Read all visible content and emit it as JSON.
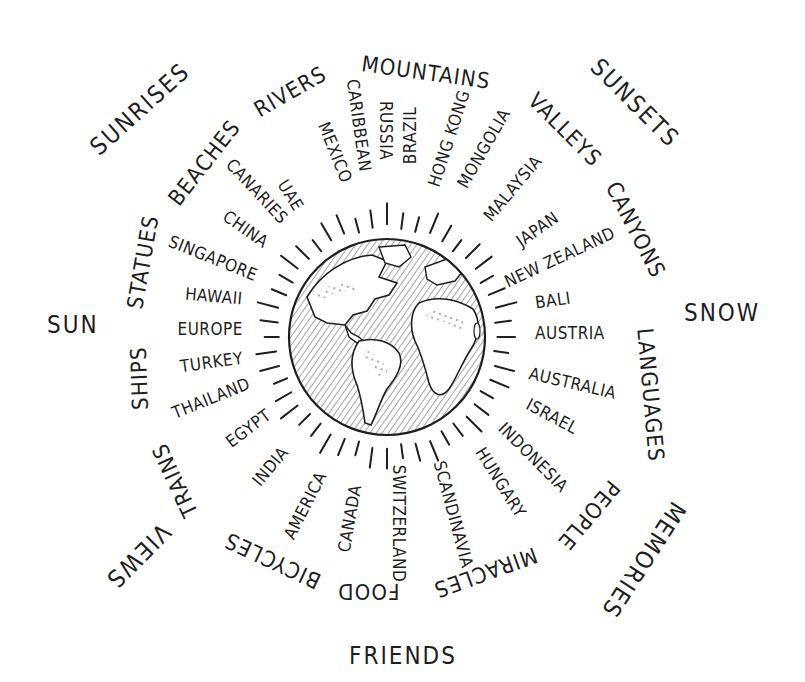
{
  "center": {
    "x": 387,
    "y": 337,
    "globe_radius": 100,
    "icon": "globe-icon"
  },
  "colors": {
    "ink": "#1e1e1e",
    "background": "#ffffff"
  },
  "inner_ring": [
    {
      "label": "MEXICO",
      "x": 335,
      "y": 152,
      "rot": 68
    },
    {
      "label": "CARIBBEAN",
      "x": 358,
      "y": 125,
      "rot": 82
    },
    {
      "label": "RUSSIA",
      "x": 385,
      "y": 130,
      "rot": 90
    },
    {
      "label": "BRAZIL",
      "x": 410,
      "y": 135,
      "rot": -90
    },
    {
      "label": "HONG KONG",
      "x": 449,
      "y": 138,
      "rot": -72
    },
    {
      "label": "MONGOLIA",
      "x": 484,
      "y": 148,
      "rot": -60
    },
    {
      "label": "MALAYSIA",
      "x": 513,
      "y": 188,
      "rot": -50
    },
    {
      "label": "JAPAN",
      "x": 537,
      "y": 229,
      "rot": -35
    },
    {
      "label": "NEW ZEALAND",
      "x": 560,
      "y": 257,
      "rot": -25
    },
    {
      "label": "BALI",
      "x": 553,
      "y": 300,
      "rot": -8
    },
    {
      "label": "AUSTRIA",
      "x": 570,
      "y": 333,
      "rot": 0
    },
    {
      "label": "AUSTRALIA",
      "x": 572,
      "y": 383,
      "rot": 13
    },
    {
      "label": "ISRAEL",
      "x": 552,
      "y": 416,
      "rot": 28
    },
    {
      "label": "INDONESIA",
      "x": 533,
      "y": 457,
      "rot": 45
    },
    {
      "label": "HUNGARY",
      "x": 500,
      "y": 482,
      "rot": 58
    },
    {
      "label": "SCANDINAVIA",
      "x": 453,
      "y": 514,
      "rot": 75
    },
    {
      "label": "SWITZERLAND",
      "x": 399,
      "y": 523,
      "rot": 90
    },
    {
      "label": "CANADA",
      "x": 350,
      "y": 518,
      "rot": -80
    },
    {
      "label": "AMERICA",
      "x": 305,
      "y": 505,
      "rot": -63
    },
    {
      "label": "INDIA",
      "x": 270,
      "y": 466,
      "rot": -50
    },
    {
      "label": "EGYPT",
      "x": 248,
      "y": 428,
      "rot": -37
    },
    {
      "label": "THAILAND",
      "x": 211,
      "y": 398,
      "rot": -22
    },
    {
      "label": "TURKEY",
      "x": 211,
      "y": 362,
      "rot": -8
    },
    {
      "label": "EUROPE",
      "x": 210,
      "y": 329,
      "rot": 0
    },
    {
      "label": "HAWAII",
      "x": 214,
      "y": 296,
      "rot": 5
    },
    {
      "label": "SINGAPORE",
      "x": 213,
      "y": 258,
      "rot": 22
    },
    {
      "label": "CHINA",
      "x": 245,
      "y": 229,
      "rot": 35
    },
    {
      "label": "CANARIES",
      "x": 257,
      "y": 191,
      "rot": 47
    },
    {
      "label": "UAE",
      "x": 290,
      "y": 195,
      "rot": 58
    }
  ],
  "middle_ring": [
    {
      "label": "BEACHES",
      "x": 204,
      "y": 163,
      "rot": -52
    },
    {
      "label": "RIVERS",
      "x": 290,
      "y": 92,
      "rot": -30
    },
    {
      "label": "MOUNTAINS",
      "x": 426,
      "y": 73,
      "rot": 8
    },
    {
      "label": "VALLEYS",
      "x": 564,
      "y": 130,
      "rot": 45
    },
    {
      "label": "CANYONS",
      "x": 635,
      "y": 230,
      "rot": 63
    },
    {
      "label": "LANGUAGES",
      "x": 650,
      "y": 395,
      "rot": 85
    },
    {
      "label": "PEOPLE",
      "x": 588,
      "y": 515,
      "rot": 130
    },
    {
      "label": "MIRACLES",
      "x": 485,
      "y": 572,
      "rot": 160
    },
    {
      "label": "FOOD",
      "x": 368,
      "y": 591,
      "rot": 180
    },
    {
      "label": "BICYCLES",
      "x": 272,
      "y": 560,
      "rot": -155
    },
    {
      "label": "TRAINS",
      "x": 175,
      "y": 480,
      "rot": -115
    },
    {
      "label": "SHIPS",
      "x": 140,
      "y": 378,
      "rot": -92
    },
    {
      "label": "STATUES",
      "x": 143,
      "y": 262,
      "rot": -80
    }
  ],
  "outer_ring": [
    {
      "label": "SUNRISES",
      "x": 140,
      "y": 109,
      "rot": -42
    },
    {
      "label": "SUNSETS",
      "x": 635,
      "y": 103,
      "rot": 45
    },
    {
      "label": "SUN",
      "x": 73,
      "y": 325,
      "rot": 0
    },
    {
      "label": "SNOW",
      "x": 722,
      "y": 313,
      "rot": 0
    },
    {
      "label": "VIEWS",
      "x": 138,
      "y": 556,
      "rot": 135
    },
    {
      "label": "MEMORIES",
      "x": 643,
      "y": 560,
      "rot": 123
    },
    {
      "label": "FRIENDS",
      "x": 403,
      "y": 656,
      "rot": 0
    }
  ]
}
